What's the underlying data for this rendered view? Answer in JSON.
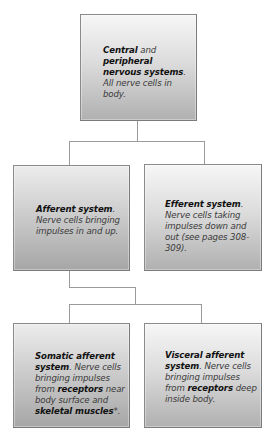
{
  "diagram": {
    "type": "hierarchy",
    "nodes": {
      "root": {
        "bold_1": "Central",
        "text_1": " and ",
        "bold_2": "peripheral nervous systems",
        "text_2": ". All nerve cells in body."
      },
      "afferent": {
        "bold_1": "Afferent system",
        "text_1": ". Nerve cells bringing impulses in and up."
      },
      "efferent": {
        "bold_1": "Efferent system",
        "text_1": ". Nerve cells taking impulses down and out (see pages 308-309)."
      },
      "somatic_afferent": {
        "bold_1": "Somatic afferent system",
        "text_1": ". Nerve cells bringing impulses from ",
        "bold_2": "receptors",
        "text_2": " near body surface and ",
        "bold_3": "skeletal muscles",
        "text_3": "*."
      },
      "visceral_afferent": {
        "bold_1": "Visceral afferent system",
        "text_1": ". Nerve cells bringing impulses from ",
        "bold_2": "receptors",
        "text_2": " deep inside body."
      }
    },
    "edges": [
      [
        "root",
        "afferent"
      ],
      [
        "root",
        "efferent"
      ],
      [
        "afferent",
        "somatic_afferent"
      ],
      [
        "afferent",
        "visceral_afferent"
      ]
    ]
  }
}
